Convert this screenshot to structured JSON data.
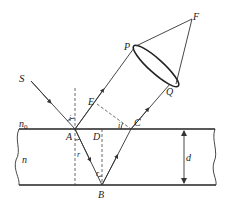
{
  "diagram": {
    "type": "thin-film interference ray diagram",
    "labels": {
      "source": "S",
      "point_A": "A",
      "point_B": "B",
      "point_C": "C",
      "point_D": "D",
      "point_E": "E",
      "point_P": "P",
      "point_Q": "Q",
      "focus_F": "F",
      "medium_top": "n",
      "medium_top_sub": "0",
      "medium_film": "n",
      "thickness": "d",
      "incidence_angle": "i",
      "refraction_angle_A": "r",
      "refraction_angle_B": "r",
      "angle_at_C": "i"
    },
    "colors": {
      "line": "#333333",
      "background": "#ffffff"
    }
  }
}
